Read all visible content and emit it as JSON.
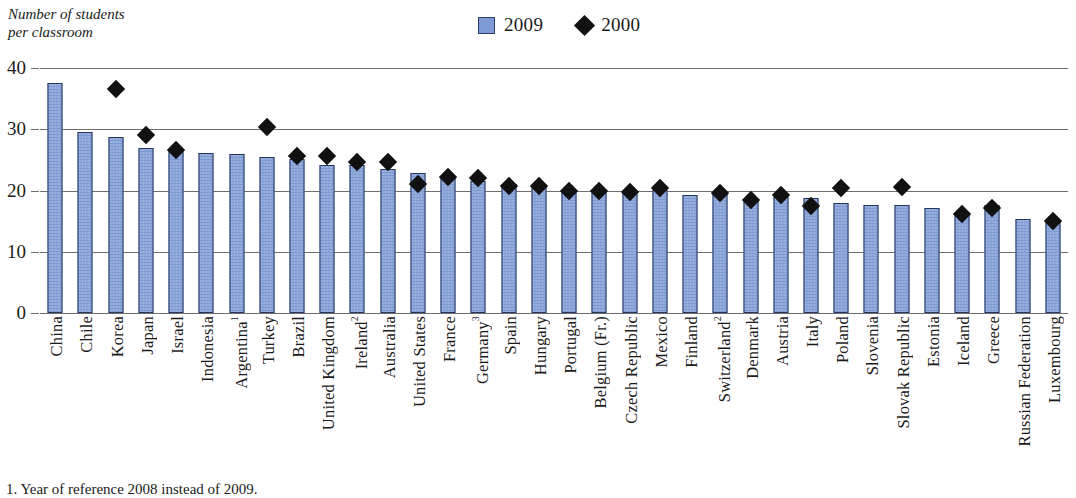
{
  "axis_title": "Number of students\nper classroom",
  "legend": {
    "items": [
      {
        "label": "2009",
        "marker": "bar-swatch",
        "color": "#7d9ad4"
      },
      {
        "label": "2000",
        "marker": "diamond-marker",
        "color": "#111111"
      }
    ]
  },
  "footnote": "1. Year of reference 2008 instead of 2009.",
  "chart_data": {
    "type": "bar",
    "title": "",
    "subtitle": "",
    "xlabel": "",
    "ylabel": "Number of students per classroom",
    "ylim": [
      0,
      40
    ],
    "yticks": [
      0,
      10,
      20,
      30,
      40
    ],
    "grid": true,
    "legend_position": "top-center",
    "categories": [
      "China",
      "Chile",
      "Korea",
      "Japan",
      "Israel",
      "Indonesia",
      "Argentina¹",
      "Turkey",
      "Brazil",
      "United Kingdom",
      "Ireland²",
      "Australia",
      "United States",
      "France",
      "Germany³",
      "Spain",
      "Hungary",
      "Portugal",
      "Belgium (Fr.)",
      "Czech Republic",
      "Mexico",
      "Finland",
      "Switzerland²",
      "Denmark",
      "Austria",
      "Italy",
      "Poland",
      "Slovenia",
      "Slovak Republic",
      "Estonia",
      "Iceland",
      "Greece",
      "Russian Federation",
      "Luxembourg"
    ],
    "series": [
      {
        "name": "2009",
        "type": "bar",
        "color": "#7d9ad4",
        "values": [
          37.5,
          29.6,
          28.7,
          27.0,
          26.6,
          26.2,
          26.0,
          25.4,
          25.1,
          24.2,
          24.2,
          23.5,
          22.8,
          22.0,
          21.6,
          21.0,
          20.8,
          20.0,
          19.9,
          19.9,
          20.1,
          19.3,
          19.4,
          18.6,
          18.9,
          18.7,
          18.0,
          17.7,
          17.6,
          17.2,
          16.1,
          17.6,
          15.3,
          14.9
        ]
      },
      {
        "name": "2000",
        "type": "scatter",
        "color": "#111111",
        "values": [
          null,
          null,
          36.5,
          29.0,
          26.6,
          null,
          null,
          30.4,
          25.7,
          25.6,
          24.7,
          24.7,
          21.0,
          22.2,
          22.0,
          20.7,
          20.7,
          19.9,
          19.9,
          19.8,
          20.4,
          null,
          19.6,
          18.4,
          19.2,
          17.5,
          20.4,
          null,
          20.5,
          null,
          16.2,
          17.1,
          null,
          15.0
        ]
      }
    ]
  }
}
